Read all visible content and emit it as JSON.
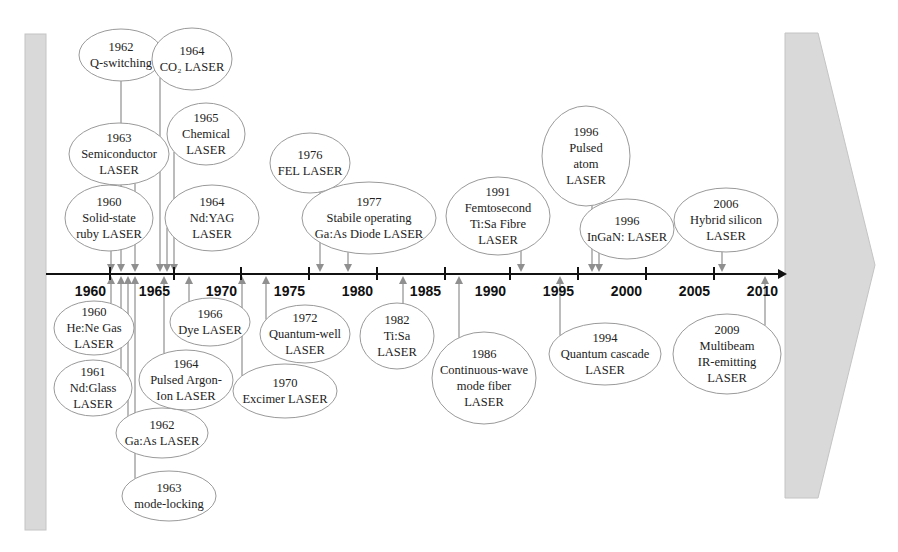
{
  "axis": {
    "ticks": [
      {
        "label": "1960",
        "x": 110
      },
      {
        "label": "1965",
        "x": 174
      },
      {
        "label": "1970",
        "x": 241
      },
      {
        "label": "1975",
        "x": 309
      },
      {
        "label": "1980",
        "x": 377
      },
      {
        "label": "1985",
        "x": 445
      },
      {
        "label": "1990",
        "x": 510
      },
      {
        "label": "1995",
        "x": 578
      },
      {
        "label": "2000",
        "x": 646
      },
      {
        "label": "2005",
        "x": 714
      },
      {
        "label": "2010",
        "x": 782
      }
    ]
  },
  "events_above": [
    {
      "year": "1962",
      "lines": [
        "Q-switching"
      ],
      "cx": 121,
      "cy": 55,
      "rx": 42,
      "ry": 26,
      "conn_x": 121
    },
    {
      "year": "1964",
      "lines": [
        "CO₂ LASER"
      ],
      "cx": 192,
      "cy": 59,
      "rx": 40,
      "ry": 31,
      "conn_x": 160
    },
    {
      "year": "1963",
      "lines": [
        "Semiconductor",
        "LASER"
      ],
      "cx": 119,
      "cy": 154,
      "rx": 50,
      "ry": 31,
      "conn_x": 135
    },
    {
      "year": "1965",
      "lines": [
        "Chemical",
        "LASER"
      ],
      "cx": 206,
      "cy": 134,
      "rx": 39,
      "ry": 31,
      "conn_x": 174
    },
    {
      "year": "1960",
      "lines": [
        "Solid-state",
        "ruby LASER"
      ],
      "cx": 109,
      "cy": 218,
      "rx": 44,
      "ry": 33,
      "conn_x": 111
    },
    {
      "year": "1964",
      "lines": [
        "Nd:YAG",
        "LASER"
      ],
      "cx": 212,
      "cy": 218,
      "rx": 47,
      "ry": 33,
      "conn_x": 167
    },
    {
      "year": "1976",
      "lines": [
        "FEL LASER"
      ],
      "cx": 310,
      "cy": 163,
      "rx": 40,
      "ry": 30,
      "conn_x": 320
    },
    {
      "year": "1977",
      "lines": [
        "Stabile operating",
        "Ga:As Diode LASER"
      ],
      "cx": 369,
      "cy": 218,
      "rx": 67,
      "ry": 36,
      "conn_x": 348
    },
    {
      "year": "1991",
      "lines": [
        "Femtosecond",
        "Ti:Sa  Fibre",
        "LASER"
      ],
      "cx": 498,
      "cy": 216,
      "rx": 52,
      "ry": 39,
      "conn_x": 521
    },
    {
      "year": "1996",
      "lines": [
        "Pulsed",
        "atom",
        "LASER"
      ],
      "cx": 586,
      "cy": 156,
      "rx": 44,
      "ry": 50,
      "conn_x": 592
    },
    {
      "year": "1996",
      "lines": [
        "InGaN: LASER"
      ],
      "cx": 627,
      "cy": 229,
      "rx": 47,
      "ry": 30,
      "conn_x": 599
    },
    {
      "year": "2006",
      "lines": [
        "Hybrid silicon",
        "LASER"
      ],
      "cx": 726,
      "cy": 220,
      "rx": 52,
      "ry": 32,
      "conn_x": 722
    }
  ],
  "events_below": [
    {
      "year": "1960",
      "lines": [
        "He:Ne Gas",
        "LASER"
      ],
      "cx": 94,
      "cy": 328,
      "rx": 40,
      "ry": 27,
      "conn_x": 111
    },
    {
      "year": "1961",
      "lines": [
        "Nd:Glass",
        "LASER"
      ],
      "cx": 93,
      "cy": 388,
      "rx": 39,
      "ry": 28,
      "conn_x": 121
    },
    {
      "year": "1962",
      "lines": [
        "Ga:As LASER"
      ],
      "cx": 162,
      "cy": 433,
      "rx": 46,
      "ry": 25,
      "conn_x": 128
    },
    {
      "year": "1963",
      "lines": [
        "mode-locking"
      ],
      "cx": 169,
      "cy": 496,
      "rx": 47,
      "ry": 25,
      "conn_x": 135
    },
    {
      "year": "1964",
      "lines": [
        "Pulsed Argon-",
        "Ion LASER"
      ],
      "cx": 186,
      "cy": 380,
      "rx": 47,
      "ry": 30,
      "conn_x": 164
    },
    {
      "year": "1966",
      "lines": [
        "Dye LASER"
      ],
      "cx": 210,
      "cy": 322,
      "rx": 40,
      "ry": 24,
      "conn_x": 189
    },
    {
      "year": "1970",
      "lines": [
        "Excimer LASER"
      ],
      "cx": 285,
      "cy": 391,
      "rx": 52,
      "ry": 27,
      "conn_x": 242
    },
    {
      "year": "1972",
      "lines": [
        "Quantum-well",
        "LASER"
      ],
      "cx": 305,
      "cy": 334,
      "rx": 45,
      "ry": 29,
      "conn_x": 266
    },
    {
      "year": "1982",
      "lines": [
        "Ti:Sa",
        "LASER"
      ],
      "cx": 397,
      "cy": 336,
      "rx": 37,
      "ry": 33,
      "conn_x": 403
    },
    {
      "year": "1986",
      "lines": [
        "Continuous-wave",
        "mode fiber",
        "LASER"
      ],
      "cx": 484,
      "cy": 378,
      "rx": 52,
      "ry": 46,
      "conn_x": 459
    },
    {
      "year": "1994",
      "lines": [
        "Quantum cascade",
        "LASER"
      ],
      "cx": 605,
      "cy": 354,
      "rx": 56,
      "ry": 31,
      "conn_x": 560
    },
    {
      "year": "2009",
      "lines": [
        "Multibeam",
        "IR-emitting",
        "LASER"
      ],
      "cx": 727,
      "cy": 354,
      "rx": 54,
      "ry": 40,
      "conn_x": 765
    }
  ],
  "colors": {
    "band": "#d9d9d9",
    "connector": "#8f8f8f",
    "axis": "#111111",
    "ellipse_stroke": "#9a9a9a"
  }
}
